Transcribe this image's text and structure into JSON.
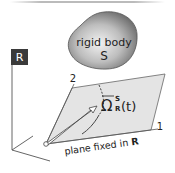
{
  "figure": {
    "body_label_line1": "rigid body",
    "body_label_line2": "S",
    "frame_label": "R",
    "axis_1_label": "1",
    "axis_2_label": "2",
    "angle_symbol": "Ω",
    "angle_superscript": "S",
    "angle_subscript": "R",
    "angle_argument": "(t)",
    "plane_caption_prefix": "plane fixed in ",
    "plane_caption_frame": "R"
  },
  "colors": {
    "frame_box": "#3a3a3a",
    "plane_fill": "#e4e4e4",
    "body_fill": "#8f8f8f",
    "line": "#555555"
  }
}
